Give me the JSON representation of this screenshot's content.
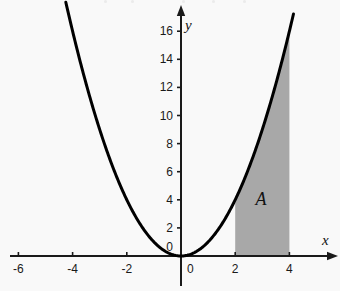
{
  "figure": {
    "background_color": "#f9f9f9",
    "curve_color": "#000000",
    "shade_color": "#a8a8a8",
    "axis_color": "#1a1a1a",
    "x_axis_name": "x",
    "y_axis_name": "y",
    "region_label": "A"
  },
  "axes": {
    "x_ticks": [
      {
        "value": -6,
        "label": "-6"
      },
      {
        "value": -4,
        "label": "-4"
      },
      {
        "value": -2,
        "label": "-2"
      },
      {
        "value": 0,
        "label": "0"
      },
      {
        "value": 2,
        "label": "2"
      },
      {
        "value": 4,
        "label": "4"
      }
    ],
    "y_ticks": [
      {
        "value": 0,
        "label": "0"
      },
      {
        "value": 2,
        "label": "2"
      },
      {
        "value": 4,
        "label": "4"
      },
      {
        "value": 6,
        "label": "6"
      },
      {
        "value": 8,
        "label": "8"
      },
      {
        "value": 10,
        "label": "10"
      },
      {
        "value": 12,
        "label": "12"
      },
      {
        "value": 14,
        "label": "14"
      },
      {
        "value": 16,
        "label": "16"
      }
    ]
  },
  "chart_data": {
    "type": "line",
    "title": "",
    "subtitle": "",
    "xlabel": "x",
    "ylabel": "y",
    "xlim": [
      -6.9,
      5.6
    ],
    "ylim": [
      -1.3,
      18.4
    ],
    "grid": false,
    "legend": false,
    "legend_position": "none",
    "series": [
      {
        "name": "y = x^2",
        "function": "y = x^2",
        "color": "#000000",
        "line_width": 3,
        "x": [
          -4.25,
          -4.0,
          -3.5,
          -3.0,
          -2.5,
          -2.0,
          -1.5,
          -1.0,
          -0.5,
          0.0,
          0.5,
          1.0,
          1.5,
          2.0,
          2.5,
          3.0,
          3.5,
          4.0,
          4.15
        ],
        "values": [
          18.06,
          16.0,
          12.25,
          9.0,
          6.25,
          4.0,
          2.25,
          1.0,
          0.25,
          0.0,
          0.25,
          1.0,
          2.25,
          4.0,
          6.25,
          9.0,
          12.25,
          16.0,
          17.22
        ]
      }
    ],
    "shaded_regions": [
      {
        "label": "A",
        "x_start": 2,
        "x_end": 4,
        "y_start": 0,
        "y_end_function": "y = x^2",
        "fill_color": "#a8a8a8",
        "label_x": 3.0,
        "label_y": 4.3
      }
    ],
    "annotations": [
      {
        "text": "A",
        "x": 3.0,
        "y": 4.3,
        "style": "italic-serif"
      }
    ],
    "x_ticks": [
      -6,
      -4,
      -2,
      0,
      2,
      4
    ],
    "y_ticks": [
      0,
      2,
      4,
      6,
      8,
      10,
      12,
      14,
      16
    ]
  }
}
